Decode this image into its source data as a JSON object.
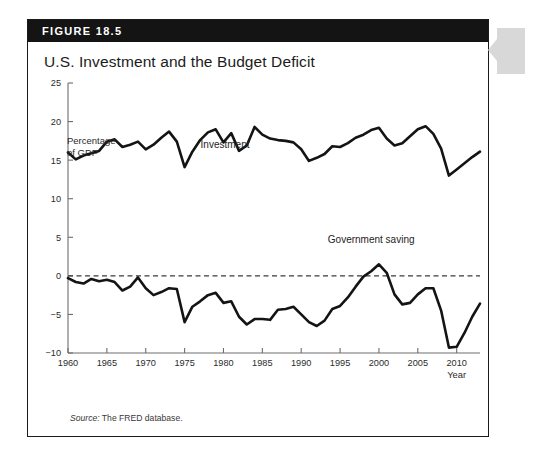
{
  "figure": {
    "number_label": "FIGURE 18.5",
    "title": "U.S. Investment and the Budget Deficit",
    "source_prefix": "Source:",
    "source_text": " The FRED database."
  },
  "chart_data": {
    "type": "line",
    "title": "U.S. Investment and the Budget Deficit",
    "ylabel": "Percentage\nof GDP",
    "xlabel": "Year",
    "ylim": [
      -10,
      25
    ],
    "xlim": [
      1960,
      2013
    ],
    "yticks": [
      -10,
      -5,
      0,
      5,
      10,
      15,
      20,
      25
    ],
    "ytick_labels": [
      "−10",
      "−5",
      "0",
      "5",
      "10",
      "15",
      "20",
      "25"
    ],
    "xticks": [
      1960,
      1965,
      1970,
      1975,
      1980,
      1985,
      1990,
      1995,
      2000,
      2005,
      2010
    ],
    "xtick_labels": [
      "1960",
      "1965",
      "1970",
      "1975",
      "1980",
      "1985",
      "1990",
      "1995",
      "2000",
      "2005",
      "2010"
    ],
    "grid": false,
    "legend": "inline-labels",
    "zero_reference_line": 0,
    "annotations": [
      {
        "text": "Investment",
        "x": 1980.2,
        "y": 16.6
      },
      {
        "text": "Government saving",
        "x": 1999.0,
        "y": 4.2
      }
    ],
    "x": [
      1960,
      1961,
      1962,
      1963,
      1964,
      1965,
      1966,
      1967,
      1968,
      1969,
      1970,
      1971,
      1972,
      1973,
      1974,
      1975,
      1976,
      1977,
      1978,
      1979,
      1980,
      1981,
      1982,
      1983,
      1984,
      1985,
      1986,
      1987,
      1988,
      1989,
      1990,
      1991,
      1992,
      1993,
      1994,
      1995,
      1996,
      1997,
      1998,
      1999,
      2000,
      2001,
      2002,
      2003,
      2004,
      2005,
      2006,
      2007,
      2008,
      2009,
      2010,
      2011,
      2012,
      2013
    ],
    "series": [
      {
        "name": "Investment",
        "values": [
          16.0,
          15.1,
          15.6,
          15.9,
          16.2,
          17.4,
          17.7,
          16.7,
          17.0,
          17.4,
          16.4,
          17.0,
          17.9,
          18.7,
          17.4,
          14.1,
          16.1,
          17.6,
          18.6,
          19.0,
          17.3,
          18.5,
          16.2,
          16.9,
          19.3,
          18.3,
          17.8,
          17.6,
          17.5,
          17.3,
          16.4,
          14.9,
          15.3,
          15.8,
          16.8,
          16.7,
          17.2,
          17.9,
          18.3,
          18.9,
          19.2,
          17.8,
          16.9,
          17.2,
          18.1,
          19.0,
          19.4,
          18.4,
          16.5,
          13.0,
          13.8,
          14.6,
          15.4,
          16.1
        ]
      },
      {
        "name": "Government saving",
        "values": [
          -0.3,
          -0.8,
          -1.0,
          -0.4,
          -0.7,
          -0.5,
          -0.8,
          -1.9,
          -1.4,
          -0.2,
          -1.6,
          -2.5,
          -2.1,
          -1.6,
          -1.7,
          -6.0,
          -4.0,
          -3.3,
          -2.5,
          -2.2,
          -3.5,
          -3.3,
          -5.3,
          -6.3,
          -5.6,
          -5.6,
          -5.7,
          -4.4,
          -4.3,
          -4.0,
          -5.0,
          -6.0,
          -6.5,
          -5.8,
          -4.3,
          -3.9,
          -2.8,
          -1.4,
          -0.1,
          0.6,
          1.5,
          0.4,
          -2.4,
          -3.7,
          -3.5,
          -2.4,
          -1.6,
          -1.6,
          -4.5,
          -9.3,
          -9.2,
          -7.4,
          -5.3,
          -3.6
        ]
      }
    ]
  }
}
